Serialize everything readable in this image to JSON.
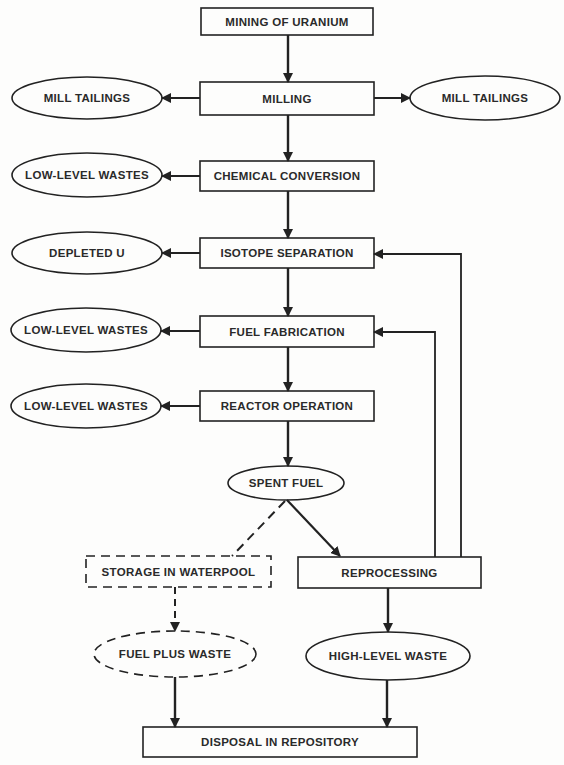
{
  "diagram": {
    "type": "flowchart",
    "colors": {
      "stroke": "#222222",
      "background": "#fdfdfc",
      "text": "#2a2a2a"
    },
    "nodes": {
      "mining": {
        "label": "MINING OF URANIUM",
        "shape": "box"
      },
      "milling": {
        "label": "MILLING",
        "shape": "box"
      },
      "mill_tailings_left": {
        "label": "MILL TAILINGS",
        "shape": "ellipse"
      },
      "mill_tailings_right": {
        "label": "MILL TAILINGS",
        "shape": "ellipse"
      },
      "chemical_conversion": {
        "label": "CHEMICAL CONVERSION",
        "shape": "box"
      },
      "llw_conversion": {
        "label": "LOW-LEVEL WASTES",
        "shape": "ellipse"
      },
      "isotope_separation": {
        "label": "ISOTOPE SEPARATION",
        "shape": "box"
      },
      "depleted_u": {
        "label": "DEPLETED U",
        "shape": "ellipse"
      },
      "fuel_fabrication": {
        "label": "FUEL FABRICATION",
        "shape": "box"
      },
      "llw_fabrication": {
        "label": "LOW-LEVEL WASTES",
        "shape": "ellipse"
      },
      "reactor_operation": {
        "label": "REACTOR OPERATION",
        "shape": "box"
      },
      "llw_reactor": {
        "label": "LOW-LEVEL WASTES",
        "shape": "ellipse"
      },
      "spent_fuel": {
        "label": "SPENT FUEL",
        "shape": "ellipse"
      },
      "storage_waterpool": {
        "label": "STORAGE IN WATERPOOL",
        "shape": "dashed-box"
      },
      "reprocessing": {
        "label": "REPROCESSING",
        "shape": "box"
      },
      "fuel_plus_waste": {
        "label": "FUEL PLUS WASTE",
        "shape": "dashed-ellipse"
      },
      "high_level_waste": {
        "label": "HIGH-LEVEL WASTE",
        "shape": "ellipse"
      },
      "disposal": {
        "label": "DISPOSAL IN REPOSITORY",
        "shape": "box"
      }
    },
    "edges": [
      {
        "from": "mining",
        "to": "milling",
        "style": "solid"
      },
      {
        "from": "milling",
        "to": "mill_tailings_left",
        "style": "solid"
      },
      {
        "from": "milling",
        "to": "mill_tailings_right",
        "style": "solid"
      },
      {
        "from": "milling",
        "to": "chemical_conversion",
        "style": "solid"
      },
      {
        "from": "chemical_conversion",
        "to": "llw_conversion",
        "style": "solid"
      },
      {
        "from": "chemical_conversion",
        "to": "isotope_separation",
        "style": "solid"
      },
      {
        "from": "isotope_separation",
        "to": "depleted_u",
        "style": "solid"
      },
      {
        "from": "isotope_separation",
        "to": "fuel_fabrication",
        "style": "solid"
      },
      {
        "from": "fuel_fabrication",
        "to": "llw_fabrication",
        "style": "solid"
      },
      {
        "from": "fuel_fabrication",
        "to": "reactor_operation",
        "style": "solid"
      },
      {
        "from": "reactor_operation",
        "to": "llw_reactor",
        "style": "solid"
      },
      {
        "from": "reactor_operation",
        "to": "spent_fuel",
        "style": "solid"
      },
      {
        "from": "spent_fuel",
        "to": "storage_waterpool",
        "style": "dashed"
      },
      {
        "from": "spent_fuel",
        "to": "reprocessing",
        "style": "solid"
      },
      {
        "from": "reprocessing",
        "to": "isotope_separation",
        "style": "solid"
      },
      {
        "from": "reprocessing",
        "to": "fuel_fabrication",
        "style": "solid"
      },
      {
        "from": "reprocessing",
        "to": "high_level_waste",
        "style": "solid"
      },
      {
        "from": "storage_waterpool",
        "to": "fuel_plus_waste",
        "style": "dashed"
      },
      {
        "from": "fuel_plus_waste",
        "to": "disposal",
        "style": "solid"
      },
      {
        "from": "high_level_waste",
        "to": "disposal",
        "style": "solid"
      }
    ]
  }
}
